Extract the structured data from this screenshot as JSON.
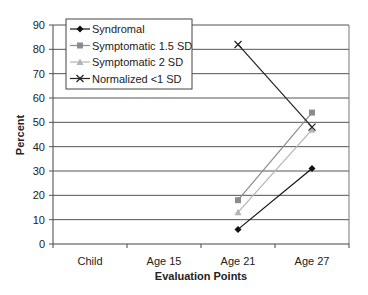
{
  "chart_data": {
    "type": "line",
    "title": "",
    "xlabel": "Evaluation Points",
    "ylabel": "Percent",
    "categories": [
      "Child",
      "Age 15",
      "Age 21",
      "Age 27"
    ],
    "ylim": [
      0,
      90
    ],
    "yticks": [
      0,
      10,
      20,
      30,
      40,
      50,
      60,
      70,
      80,
      90
    ],
    "grid": true,
    "legend_position": "upper-left inside",
    "series": [
      {
        "name": "Syndromal",
        "values": [
          null,
          null,
          6,
          31
        ],
        "color": "#111111",
        "marker": "diamond"
      },
      {
        "name": "Symptomatic 1.5 SD",
        "values": [
          null,
          null,
          18,
          54
        ],
        "color": "#8c8c8c",
        "marker": "square"
      },
      {
        "name": "Symptomatic 2 SD",
        "values": [
          null,
          null,
          13,
          47
        ],
        "color": "#b4b4b4",
        "marker": "triangle"
      },
      {
        "name": "Normalized <1 SD",
        "values": [
          null,
          null,
          82,
          48
        ],
        "color": "#222222",
        "marker": "x"
      }
    ]
  }
}
